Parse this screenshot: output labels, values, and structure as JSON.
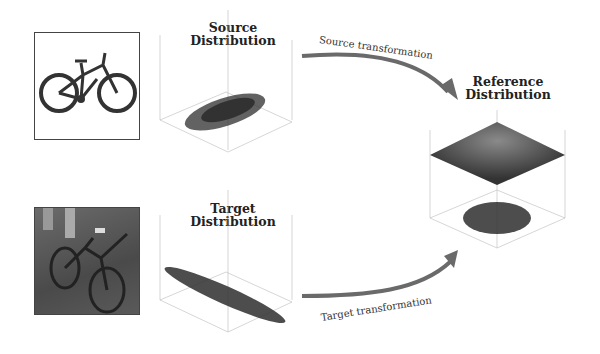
{
  "source": {
    "image_label": "bicycle (clean product photo)",
    "title_line1": "Source",
    "title_line2": "Distribution",
    "ticks": [
      "4",
      "2",
      "0",
      "-2",
      "-4",
      "-4",
      "-2",
      "0",
      "2",
      "4"
    ]
  },
  "target": {
    "image_label": "bicycle (real-world photo)",
    "title_line1": "Target",
    "title_line2": "Distribution",
    "ticks": [
      "4",
      "2",
      "0",
      "-2",
      "-4",
      "-4",
      "-2",
      "0",
      "2",
      "4"
    ]
  },
  "reference": {
    "title_line1": "Reference",
    "title_line2": "Distribution",
    "ticks": [
      "3",
      "2",
      "1",
      "0",
      "-1",
      "-2",
      "-3",
      "-3",
      "-2",
      "-1",
      "0",
      "1",
      "2",
      "3"
    ]
  },
  "arrows": {
    "source_label": "Source transformation",
    "target_label": "Target transformation"
  },
  "colors": {
    "arrow": "#6a6a6a",
    "points": "#2e2e2e",
    "surface": "#3a3a3a",
    "surface_highlight": "#8a8a8a"
  }
}
